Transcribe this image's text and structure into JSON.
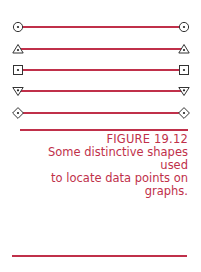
{
  "figure": {
    "label": "FIGURE 19.12",
    "caption": "Some distinctive shapes used to locate data points on graphs.",
    "caption_lines": [
      "Some distinctive shapes used",
      "to locate data points on",
      "graphs."
    ],
    "accent_color": "#c0304a",
    "marker_color": "#333333"
  },
  "markers": [
    {
      "shape": "circle-dot-icon"
    },
    {
      "shape": "triangle-up-dot-icon"
    },
    {
      "shape": "square-dot-icon"
    },
    {
      "shape": "triangle-down-dot-icon"
    },
    {
      "shape": "diamond-dot-icon"
    }
  ]
}
